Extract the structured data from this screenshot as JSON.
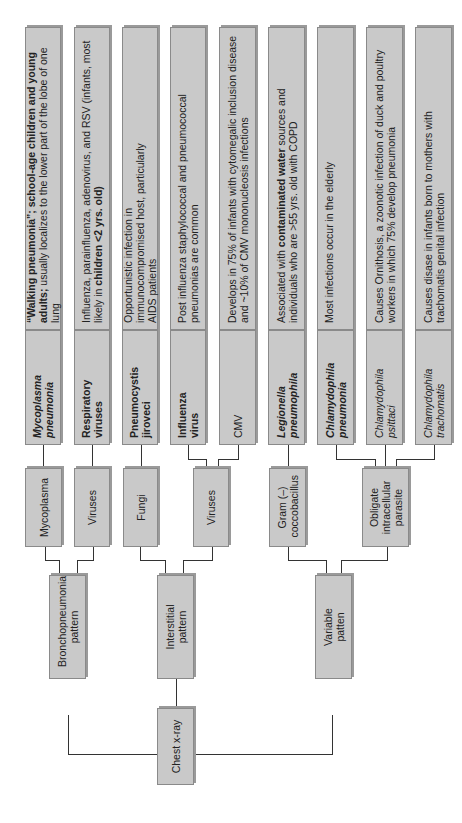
{
  "root": {
    "label": "Chest x-ray"
  },
  "patterns": [
    {
      "label": "Bronchopneumonia pattern"
    },
    {
      "label": "Interstitial pattern"
    },
    {
      "label": "Variable patten"
    }
  ],
  "categories": [
    {
      "label": "Mycoplasma",
      "pattern": "Bronchopneumonia pattern"
    },
    {
      "label": "Viruses",
      "pattern": "Bronchopneumonia pattern"
    },
    {
      "label": "Fungi",
      "pattern": "Interstitial pattern"
    },
    {
      "label": "Viruses",
      "pattern": "Interstitial pattern"
    },
    {
      "label": "Gram (–) coccobacillus",
      "pattern": "Variable patten"
    },
    {
      "label": "Obligate intracellular parasite",
      "pattern": "Variable patten"
    }
  ],
  "organisms": [
    {
      "name": "Mycoplasma pneumonia",
      "style": "bold-italic",
      "description_parts": [
        {
          "text": "“Walking pneumonia”; school-age children and young adults;",
          "bold": true
        },
        {
          "text": " usually localizes to the lower part of the lobe of one lung",
          "bold": false
        }
      ]
    },
    {
      "name": "Respiratory viruses",
      "style": "bold",
      "description_parts": [
        {
          "text": "Influenza, parainfluenza, adenovirus, and RSV (infants, most likely in ",
          "bold": false
        },
        {
          "text": "children <2 yrs. old)",
          "bold": true
        }
      ]
    },
    {
      "name": "Pneumocystis jiroveci",
      "style": "bold",
      "description_parts": [
        {
          "text": "Opportunistic infection in immunocompromised host, particularly AIDS patients",
          "bold": false
        }
      ]
    },
    {
      "name": "Influenza virus",
      "style": "bold",
      "description_parts": [
        {
          "text": "Post influenza staphylococcal and pneumococcal pneumonias are common",
          "bold": false
        }
      ]
    },
    {
      "name": "CMV",
      "style": "normal",
      "description_parts": [
        {
          "text": "Develops in 75% of infants with cytomegalic inclusion disease and ~10% of CMV mononucleosis infections",
          "bold": false
        }
      ]
    },
    {
      "name": "Legionella pneumophila",
      "style": "bold-italic",
      "description_parts": [
        {
          "text": "Associated with ",
          "bold": false
        },
        {
          "text": "contaminated water",
          "bold": true
        },
        {
          "text": " sources and individuals who are >55 yrs. old with COPD",
          "bold": false
        }
      ]
    },
    {
      "name": "Chlamydophila pneumonia",
      "style": "bold-italic",
      "description_parts": [
        {
          "text": "Most infections occur in the elderly",
          "bold": false
        }
      ]
    },
    {
      "name": "Chlamydophila psittaci",
      "style": "italic",
      "description_parts": [
        {
          "text": "Causes Ornithosis, a zoonotic infection of duck and poultry workers in which 75% develop pneumonia",
          "bold": false
        }
      ]
    },
    {
      "name": "Chlamydophila trachomatis",
      "style": "italic",
      "description_parts": [
        {
          "text": "Causes disase in infants born to mothers with trachomatis genital infection",
          "bold": false
        }
      ]
    }
  ],
  "colors": {
    "box_fill": "#c9c9c9",
    "box_border": "#8a8a8a",
    "line": "#333333",
    "background": "#ffffff"
  }
}
